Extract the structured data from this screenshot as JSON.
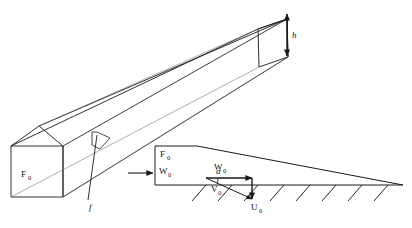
{
  "figure": {
    "background_color": "#ffffff",
    "line_color": "#1a1a1a",
    "thin_line_color": "#555555"
  },
  "labels": {
    "beam_face_force": "F",
    "beam_face_force_sub": "0",
    "gap_height": "h",
    "detail_leader": "f",
    "section_force": "F",
    "section_force_sub": "0",
    "section_relative_velocity": "W",
    "section_relative_velocity_sub": "0",
    "vector_w": "W",
    "vector_w_sub": "0",
    "vector_v": "V",
    "vector_v_sub": "0",
    "vector_u": "U",
    "vector_u_sub": "0",
    "angle_alpha": "α"
  },
  "icons": {
    "inflow_arrow": "arrow-right-icon",
    "gap_dimension_arrow": "double-arrow-vertical-icon",
    "velocity_w_arrow": "arrow-right-icon",
    "velocity_u_arrow": "arrow-down-icon",
    "velocity_v_arrow": "arrow-diagonal-icon",
    "hatching": "ground-hatching-icon"
  }
}
